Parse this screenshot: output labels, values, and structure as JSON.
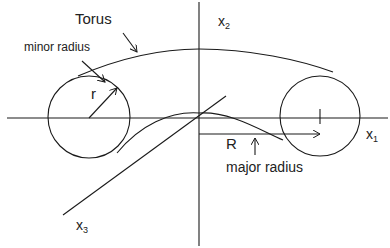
{
  "diagram": {
    "title": "Torus",
    "labels": {
      "torus": "Torus",
      "minor_radius": "minor radius",
      "r": "r",
      "R": "R",
      "major_radius": "major radius"
    },
    "axes": {
      "x1": {
        "base": "x",
        "sub": "1"
      },
      "x2": {
        "base": "x",
        "sub": "2"
      },
      "x3": {
        "base": "x",
        "sub": "3"
      }
    },
    "colors": {
      "stroke": "#1a1a1a",
      "background": "#ffffff"
    }
  }
}
